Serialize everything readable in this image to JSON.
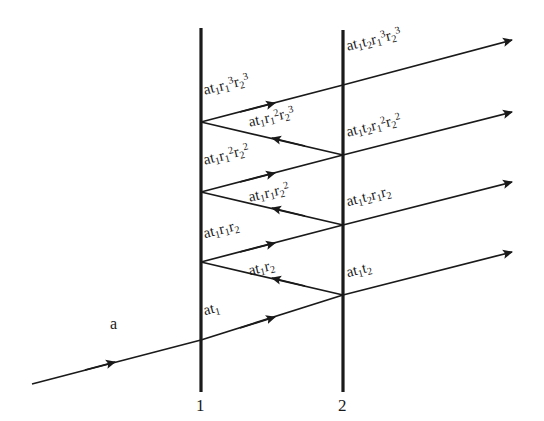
{
  "figure": {
    "type": "optics-multiple-beam-interference-diagram",
    "background_color": "#ffffff",
    "line_color": "#1a1a1a",
    "text_color": "#1a1a1a"
  },
  "surfaces": [
    {
      "name": "surface-1",
      "label": "1",
      "x": 201,
      "y_top": 28,
      "y_bottom": 392
    },
    {
      "name": "surface-2",
      "label": "2",
      "x": 343,
      "y_top": 30,
      "y_bottom": 392
    }
  ],
  "incident_ray": {
    "label": "a"
  },
  "internal_rays": [
    {
      "id": "t1",
      "label_html": "at<sub>1</sub>",
      "direction": "up-right"
    },
    {
      "id": "r2",
      "label_html": "at<sub>1</sub>r<sub>2</sub>",
      "direction": "down-left"
    },
    {
      "id": "r1r2",
      "label_html": "at<sub>1</sub>r<sub>1</sub>r<sub>2</sub>",
      "direction": "up-right"
    },
    {
      "id": "r1r2sq",
      "label_html": "at<sub>1</sub>r<sub>1</sub>r<sub>2</sub><sup>2</sup>",
      "direction": "down-left"
    },
    {
      "id": "r1sqr2sq",
      "label_html": "at<sub>1</sub>r<sub>1</sub><sup>2</sup>r<sub>2</sub><sup>2</sup>",
      "direction": "up-right"
    },
    {
      "id": "r1sqr2cu",
      "label_html": "at<sub>1</sub>r<sub>1</sub><sup>2</sup>r<sub>2</sub><sup>3</sup>",
      "direction": "down-left"
    },
    {
      "id": "r1cur2cu",
      "label_html": "at<sub>1</sub>r<sub>1</sub><sup>3</sup>r<sub>2</sub><sup>3</sup>",
      "direction": "up-right"
    }
  ],
  "transmitted_rays": [
    {
      "id": "out1",
      "label_html": "at<sub>1</sub>t<sub>2</sub>"
    },
    {
      "id": "out2",
      "label_html": "at<sub>1</sub>t<sub>2</sub>r<sub>1</sub>r<sub>2</sub>"
    },
    {
      "id": "out3",
      "label_html": "at<sub>1</sub>t<sub>2</sub>r<sub>1</sub><sup>2</sup>r<sub>2</sub><sup>2</sup>"
    },
    {
      "id": "out4",
      "label_html": "at<sub>1</sub>t<sub>2</sub>r<sub>1</sub><sup>3</sup>r<sub>2</sub><sup>3</sup>"
    }
  ]
}
